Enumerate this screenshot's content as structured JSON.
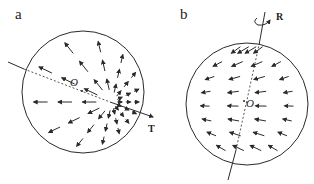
{
  "panels": [
    {
      "id": "a",
      "label": "a",
      "origin_label": "O",
      "vector_label": "T",
      "description": "Translation field: arrows radiate outward from a focus point on the sphere along the T direction"
    },
    {
      "id": "b",
      "label": "b",
      "origin_label": "O",
      "vector_label": "R",
      "description": "Rotation field: arrows flow horizontally around a tilted axis R"
    }
  ],
  "colors": {
    "stroke": "#2a2a2a",
    "background": "#ffffff"
  }
}
